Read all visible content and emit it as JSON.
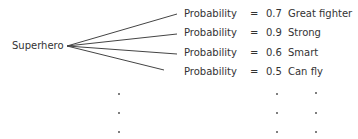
{
  "root": {
    "label": "Superhero"
  },
  "rows": [
    {
      "term": "Probability",
      "eq": "=",
      "value": "0.7",
      "attribute": "Great fighter"
    },
    {
      "term": "Probability",
      "eq": "=",
      "value": "0.9",
      "attribute": "Strong"
    },
    {
      "term": "Probability",
      "eq": "=",
      "value": "0.6",
      "attribute": "Smart"
    },
    {
      "term": "Probability",
      "eq": "=",
      "value": "0.5",
      "attribute": "Can fly"
    }
  ],
  "continuation": {
    "symbol": "ellipsis-dots",
    "rows": 3,
    "columns": 3
  },
  "colors": {
    "text": "#333333",
    "line": "#444444"
  }
}
